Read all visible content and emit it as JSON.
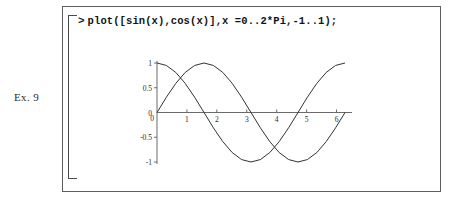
{
  "exercise": {
    "label": "Ex. 9"
  },
  "worksheet": {
    "prompt": ">",
    "command": "plot([sin(x),cos(x)],x =0..2*Pi,-1..1);"
  },
  "colors": {
    "frame": "#5d5d5d",
    "bracket": "#4a4a4a",
    "text": "#141414",
    "axis": "#6a6a6a",
    "curve": "#333333",
    "background": "#ffffff"
  },
  "chart_data": {
    "type": "line",
    "title": "",
    "xlabel": "",
    "ylabel": "",
    "xlim": [
      0,
      6.283185307
    ],
    "ylim": [
      -1,
      1
    ],
    "grid": false,
    "legend": "none",
    "xticks": [
      0,
      1,
      2,
      3,
      4,
      5,
      6
    ],
    "xtick_labels": [
      "0",
      "1",
      "2",
      "3",
      "4",
      "5",
      "6"
    ],
    "yticks": [
      -1,
      -0.5,
      0,
      0.5,
      1
    ],
    "ytick_labels": [
      "-1",
      "-0.5",
      "0",
      "0.5",
      "1"
    ],
    "series": [
      {
        "name": "sin(x)",
        "x": [
          0,
          0.3141593,
          0.6283185,
          0.9424778,
          1.2566371,
          1.5707963,
          1.8849556,
          2.1991149,
          2.5132741,
          2.8274334,
          3.1415927,
          3.4557519,
          3.7699112,
          4.0840704,
          4.3982297,
          4.712389,
          5.0265482,
          5.3407075,
          5.6548668,
          5.969026,
          6.2831853
        ],
        "values": [
          0,
          0.309,
          0.588,
          0.809,
          0.951,
          1,
          0.951,
          0.809,
          0.588,
          0.309,
          0,
          -0.309,
          -0.588,
          -0.809,
          -0.951,
          -1,
          -0.951,
          -0.809,
          -0.588,
          -0.309,
          0
        ]
      },
      {
        "name": "cos(x)",
        "x": [
          0,
          0.3141593,
          0.6283185,
          0.9424778,
          1.2566371,
          1.5707963,
          1.8849556,
          2.1991149,
          2.5132741,
          2.8274334,
          3.1415927,
          3.4557519,
          3.7699112,
          4.0840704,
          4.3982297,
          4.712389,
          5.0265482,
          5.3407075,
          5.6548668,
          5.969026,
          6.2831853
        ],
        "values": [
          1,
          0.951,
          0.809,
          0.588,
          0.309,
          0,
          -0.309,
          -0.588,
          -0.809,
          -0.951,
          -1,
          -0.951,
          -0.809,
          -0.588,
          -0.309,
          0,
          0.309,
          0.588,
          0.809,
          0.951,
          1
        ]
      }
    ]
  }
}
